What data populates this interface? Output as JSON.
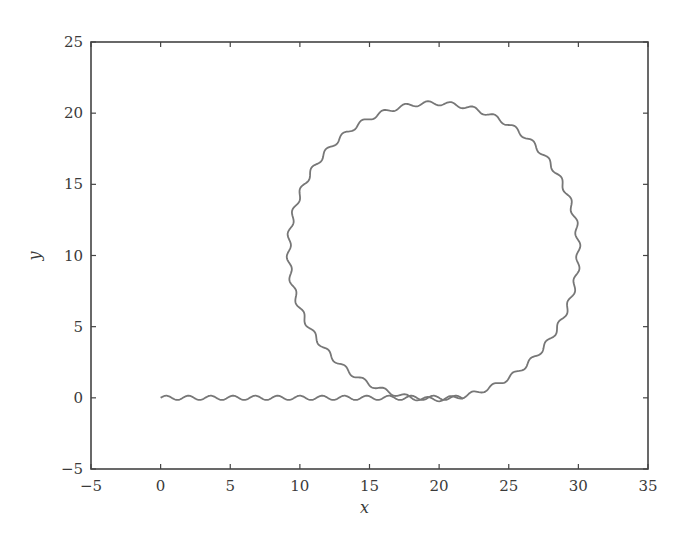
{
  "chart_data": {
    "type": "line",
    "title": "",
    "xlabel": "x",
    "ylabel": "y",
    "xlim": [
      -5,
      35
    ],
    "ylim": [
      -5,
      25
    ],
    "xticks": [
      -5,
      0,
      5,
      10,
      15,
      20,
      25,
      30,
      35
    ],
    "yticks": [
      -5,
      0,
      5,
      10,
      15,
      20,
      25
    ],
    "xtick_labels": [
      "−5",
      "0",
      "5",
      "10",
      "15",
      "20",
      "25",
      "30",
      "35"
    ],
    "ytick_labels": [
      "−5",
      "0",
      "5",
      "10",
      "15",
      "20",
      "25"
    ],
    "grid": false,
    "legend": null,
    "series": [
      {
        "name": "trajectory",
        "color": "#777777",
        "description": "Wavy straight-line motion along y≈0 from x=0 to x≈21.7, then a wavy circular loop",
        "segments": [
          {
            "kind": "wavy-line",
            "x_start": 0,
            "x_end": 21.7,
            "y": 0,
            "wave_amplitude": 0.15,
            "wave_period": 1.6
          },
          {
            "kind": "wavy-circle",
            "center": [
              19.6,
              10.3
            ],
            "radius": 10.4,
            "x_range": [
              9.1,
              30.0
            ],
            "y_range": [
              -0.2,
              20.8
            ],
            "wave_amplitude": 0.15,
            "wave_count": 40
          }
        ]
      }
    ],
    "axis_color": "#444444"
  },
  "layout": {
    "plot_left": 91,
    "plot_right": 648,
    "plot_top": 42,
    "plot_bottom": 469
  }
}
